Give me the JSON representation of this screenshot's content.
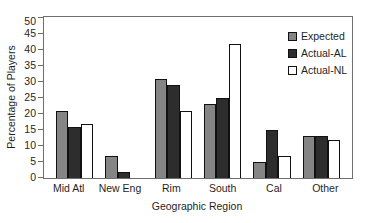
{
  "figure": {
    "background": "#ffffff",
    "frame_color": "#6e6e6e",
    "text_color": "#1f1f1f"
  },
  "chart_data": {
    "type": "bar",
    "title": "",
    "xlabel": "Geographic Region",
    "ylabel": "Percentage of Players",
    "categories": [
      "Mid Atl",
      "New Eng",
      "Rim",
      "South",
      "Cal",
      "Other"
    ],
    "series": [
      {
        "name": "Expected",
        "color": "#858585",
        "values": [
          21,
          7,
          31,
          23,
          5,
          13
        ]
      },
      {
        "name": "Actual-AL",
        "color": "#2d2d2d",
        "values": [
          16,
          2,
          29,
          25,
          15,
          13
        ]
      },
      {
        "name": "Actual-NL",
        "color": "#ffffff",
        "values": [
          17,
          0,
          21,
          42,
          7,
          12
        ]
      }
    ],
    "ylim": [
      0,
      50
    ],
    "ytick_step": 5,
    "yticks": [
      0,
      5,
      10,
      15,
      20,
      25,
      30,
      35,
      40,
      45,
      50
    ],
    "grid": false,
    "legend_position": "top-right-inside",
    "bar_border_color": "#111111"
  }
}
